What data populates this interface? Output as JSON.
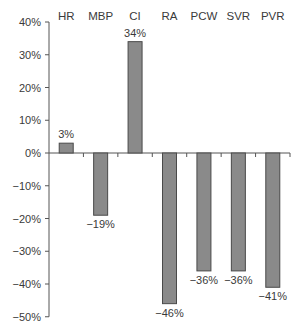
{
  "chart_data": {
    "type": "bar",
    "title": "",
    "xlabel": "",
    "ylabel": "",
    "categories": [
      "HR",
      "MBP",
      "CI",
      "RA",
      "PCW",
      "SVR",
      "PVR"
    ],
    "values": [
      3,
      -19,
      34,
      -46,
      -36,
      -36,
      -41
    ],
    "value_labels": [
      "3%",
      "−19%",
      "34%",
      "−46%",
      "−36%",
      "−36%",
      "−41%"
    ],
    "ylim": [
      -50,
      40
    ],
    "yticks": [
      40,
      30,
      20,
      10,
      0,
      -10,
      -20,
      -30,
      -40,
      -50
    ],
    "ytick_labels": [
      "40%",
      "30%",
      "20%",
      "10%",
      "0%",
      "−10%",
      "−20%",
      "−30%",
      "−40%",
      "−50%"
    ],
    "category_label_position": "top",
    "grid": false,
    "legend": null,
    "bar_color": "#8a8a8a",
    "bar_edge_color": "#4a4a4a"
  }
}
